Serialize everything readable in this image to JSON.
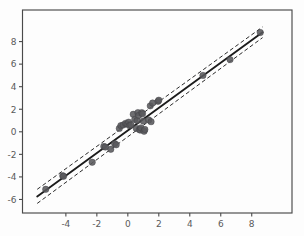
{
  "chart_data": {
    "type": "scatter",
    "title": "",
    "subtitle": "",
    "xlabel": "",
    "ylabel": "",
    "xlim": [
      -6.8,
      10.6
    ],
    "ylim": [
      -7.2,
      10.8
    ],
    "xticks": [
      -4,
      -2,
      0,
      2,
      4,
      6,
      8
    ],
    "xtick_labels": [
      "-4",
      "-2",
      "0",
      "2",
      "4",
      "6",
      "8"
    ],
    "yticks": [
      -6,
      -4,
      -2,
      0,
      2,
      4,
      6,
      8
    ],
    "ytick_labels": [
      "-6",
      "-4",
      "-2",
      "0",
      "2",
      "4",
      "6",
      "8"
    ],
    "grid": false,
    "legend": null,
    "legend_position": "none",
    "marker_color": "#59595c",
    "line_color": "#1b1b1b",
    "band_color": "#2b2b2b",
    "background_color": "#fdfdfd",
    "axis_color": "#4a4a4a",
    "tick_label_color": "#5a5a5a",
    "series": [
      {
        "name": "observations",
        "marker": "circle",
        "points": [
          [
            -5.3,
            -5.1
          ],
          [
            -4.2,
            -3.9
          ],
          [
            -4.15,
            -3.95
          ],
          [
            -2.3,
            -2.7
          ],
          [
            -1.55,
            -1.3
          ],
          [
            -1.45,
            -1.35
          ],
          [
            -1.1,
            -1.55
          ],
          [
            -0.85,
            -1.05
          ],
          [
            -0.75,
            -1.15
          ],
          [
            -0.55,
            0.3
          ],
          [
            -0.45,
            0.55
          ],
          [
            -0.3,
            0.6
          ],
          [
            -0.15,
            0.75
          ],
          [
            -0.05,
            0.7
          ],
          [
            0.05,
            0.85
          ],
          [
            0.1,
            0.55
          ],
          [
            0.2,
            0.6
          ],
          [
            0.35,
            1.55
          ],
          [
            0.45,
            1.1
          ],
          [
            0.55,
            0.3
          ],
          [
            0.6,
            1.0
          ],
          [
            0.65,
            1.7
          ],
          [
            0.7,
            1.45
          ],
          [
            0.75,
            0.2
          ],
          [
            0.8,
            0.15
          ],
          [
            0.85,
            0.35
          ],
          [
            0.9,
            1.7
          ],
          [
            0.95,
            1.6
          ],
          [
            1.0,
            0.95
          ],
          [
            1.05,
            0.05
          ],
          [
            1.1,
            0.2
          ],
          [
            1.35,
            1.05
          ],
          [
            1.45,
            2.3
          ],
          [
            1.5,
            0.9
          ],
          [
            1.6,
            2.55
          ],
          [
            1.95,
            2.7
          ],
          [
            2.0,
            2.8
          ],
          [
            4.85,
            5.0
          ],
          [
            6.6,
            6.4
          ],
          [
            8.55,
            8.8
          ]
        ]
      }
    ],
    "fit_line": {
      "name": "regression-fit",
      "style": "solid",
      "slope": 1.0,
      "intercept": 0.12,
      "x_start": -5.85,
      "y_start": -5.73,
      "x_end": 8.7,
      "y_end": 8.82
    },
    "bands": [
      {
        "name": "upper-confidence-band",
        "style": "dashed",
        "x_start": -5.85,
        "y_start": -5.1,
        "x_end": 8.7,
        "y_end": 9.3
      },
      {
        "name": "lower-confidence-band",
        "style": "dashed",
        "x_start": -5.85,
        "y_start": -6.35,
        "x_end": 8.7,
        "y_end": 8.35
      }
    ]
  }
}
